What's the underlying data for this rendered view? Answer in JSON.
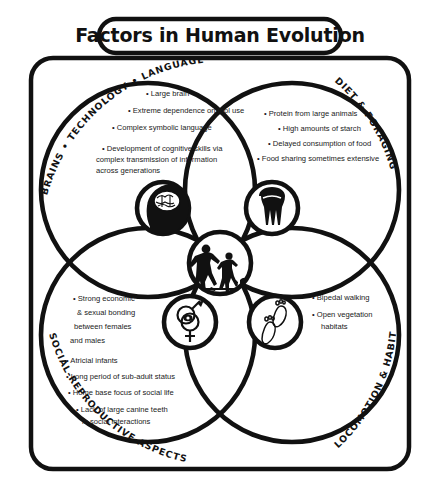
{
  "poster": {
    "title": "Factors in Human Evolution",
    "background_color": "#ffffff",
    "ink_color": "#111111"
  },
  "quadrants": [
    {
      "id": "brains",
      "label": "BRAINS • TECHNOLOGY • LANGUAGE • CULTURE",
      "position": "top-left",
      "icon": "head-with-brain-icon",
      "bullets": [
        "• Large brain",
        "• Extreme dependence on tool use",
        "• Complex symbolic language",
        "• Development of cognitive skills via",
        "complex transmission of information",
        "across generations"
      ]
    },
    {
      "id": "diet",
      "label": "DIET & FORAGING",
      "position": "top-right",
      "icon": "molar-tooth-icon",
      "bullets": [
        "• Protein from large animals",
        "• High amounts of starch",
        "• Delayed consumption of food",
        "• Food sharing sometimes extensive"
      ]
    },
    {
      "id": "social",
      "label": "SOCIAL-REPRODUCTIVE ASPECTS",
      "position": "bottom-left",
      "icon": "male-female-symbols-icon",
      "bullets": [
        "• Strong economic",
        "& sexual bonding",
        "between females",
        "and males",
        "• Atricial infants",
        "•  Long period of sub-adult status",
        "• Home base focus of social life",
        "•  Lack of large canine teeth",
        "in social interactions"
      ]
    },
    {
      "id": "locomotion",
      "label": "LOCOMOTION & HABITAT",
      "position": "bottom-right",
      "icon": "footprints-icon",
      "bullets": [
        "• Bipedal walking",
        "• Open vegetation",
        "habitats"
      ]
    }
  ],
  "center": {
    "icon": "human-evolution-silhouettes-icon",
    "description": "Walking hominin figures with a small animal"
  }
}
